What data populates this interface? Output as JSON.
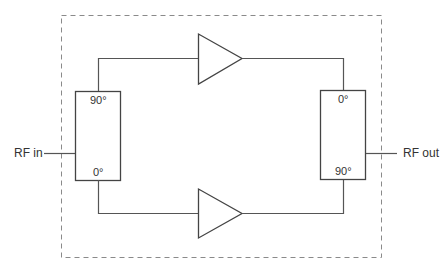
{
  "diagram": {
    "type": "balanced-amplifier-block-diagram",
    "colors": {
      "line": "#555555",
      "dash": "#888888",
      "text": "#333333",
      "background": "#ffffff"
    },
    "ports": {
      "input": "RF in",
      "output": "RF out"
    },
    "input_hybrid": {
      "top_label": "90°",
      "bottom_label": "0°"
    },
    "output_hybrid": {
      "top_label": "0°",
      "bottom_label": "90°"
    },
    "amplifiers": [
      {
        "name": "upper amplifier"
      },
      {
        "name": "lower amplifier"
      }
    ],
    "enclosure": "dashed boundary"
  }
}
